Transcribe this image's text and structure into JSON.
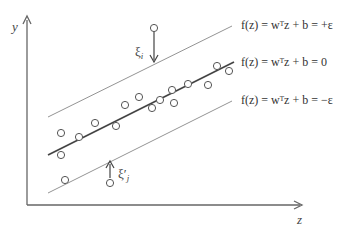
{
  "axes": {
    "x_label": "z",
    "y_label": "y"
  },
  "lines": [
    {
      "name": "upper-margin",
      "label": "f(z) = wᵀz + b = +ε",
      "style": "thin"
    },
    {
      "name": "regression",
      "label": "f(z) = wᵀz + b = 0",
      "style": "bold"
    },
    {
      "name": "lower-margin",
      "label": "f(z) = wᵀz + b = −ε",
      "style": "thin"
    }
  ],
  "slack": {
    "upper": {
      "label": "ξ",
      "sub": "i"
    },
    "lower": {
      "label": "ξ′",
      "sub": "j"
    }
  },
  "points": [
    [
      61,
      133
    ],
    [
      61,
      155
    ],
    [
      65,
      180
    ],
    [
      79,
      137
    ],
    [
      95,
      123
    ],
    [
      116,
      126
    ],
    [
      125,
      105
    ],
    [
      139,
      97
    ],
    [
      152,
      108
    ],
    [
      160,
      100
    ],
    [
      172,
      90
    ],
    [
      174,
      103
    ],
    [
      188,
      84
    ],
    [
      208,
      85
    ],
    [
      217,
      66
    ],
    [
      229,
      71
    ],
    [
      154,
      28
    ],
    [
      110,
      183
    ]
  ],
  "colors": {
    "line": "#555555",
    "text": "#333333",
    "background": "#ffffff"
  }
}
